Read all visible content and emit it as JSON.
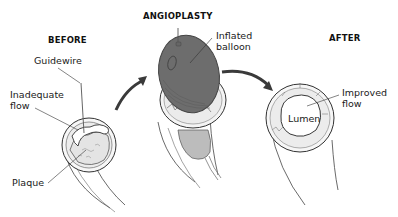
{
  "diagram": {
    "stages": [
      {
        "id": "before",
        "title": "BEFORE"
      },
      {
        "id": "angioplasty",
        "title": "ANGIOPLASTY"
      },
      {
        "id": "after",
        "title": "AFTER"
      }
    ],
    "labels": {
      "guidewire": "Guidewire",
      "inadequate_flow": "Inadequate\nflow",
      "plaque": "Plaque",
      "inflated_balloon": "Inflated\nballoon",
      "improved_flow": "Improved\nflow",
      "lumen": "Lumen"
    },
    "colors": {
      "balloon": "#6d6d6d",
      "balloon_dark": "#555555",
      "catheter_fill": "#b9b9b9",
      "plaque_fill": "#e9e9e9",
      "line": "#333333",
      "arrow": "#3a3a3a"
    }
  }
}
